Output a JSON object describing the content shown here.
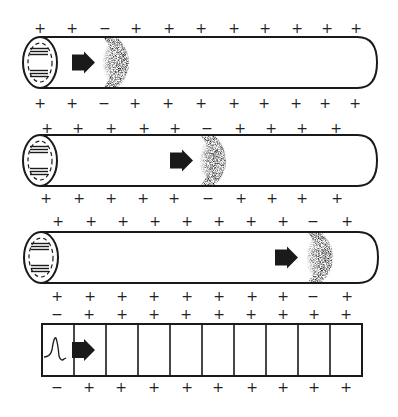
{
  "figure": {
    "colors": {
      "ink": "#1a1a1a",
      "background": "#ffffff",
      "stipple": "#111111"
    },
    "tubes": [
      {
        "id": "tube-1",
        "top": 37,
        "bottom": 88,
        "left": 22,
        "right": 377,
        "arrow_x": 72,
        "wavefront_x": 110,
        "signs_above": {
          "y": 28,
          "x": [
            40,
            72,
            105,
            136,
            169,
            201,
            234,
            265,
            297,
            327,
            356
          ],
          "values": [
            "+",
            "+",
            "−",
            "+",
            "+",
            "+",
            "+",
            "+",
            "+",
            "+",
            "+"
          ]
        },
        "signs_below": {
          "y": 103,
          "x": [
            40,
            72,
            104,
            135,
            168,
            201,
            234,
            264,
            296,
            325,
            355
          ],
          "values": [
            "+",
            "+",
            "−",
            "+",
            "+",
            "+",
            "+",
            "+",
            "+",
            "+",
            "+"
          ]
        }
      },
      {
        "id": "tube-2",
        "top": 135,
        "bottom": 186,
        "left": 22,
        "right": 377,
        "arrow_x": 170,
        "wavefront_x": 207,
        "signs_above": {
          "y": 128,
          "x": [
            47,
            78,
            111,
            144,
            175,
            207,
            240,
            271,
            302,
            336
          ],
          "values": [
            "+",
            "+",
            "+",
            "+",
            "+",
            "−",
            "+",
            "+",
            "+",
            "+"
          ]
        },
        "signs_below": {
          "y": 198,
          "x": [
            46,
            79,
            111,
            143,
            174,
            208,
            241,
            272,
            302,
            337
          ],
          "values": [
            "+",
            "+",
            "+",
            "+",
            "+",
            "−",
            "+",
            "+",
            "+",
            "+"
          ]
        }
      },
      {
        "id": "tube-3",
        "top": 232,
        "bottom": 283,
        "left": 23,
        "right": 378,
        "arrow_x": 275,
        "wavefront_x": 314,
        "signs_above": {
          "y": 221,
          "x": [
            58,
            91,
            123,
            155,
            187,
            219,
            251,
            283,
            313,
            347
          ],
          "values": [
            "+",
            "+",
            "+",
            "+",
            "+",
            "+",
            "+",
            "+",
            "−",
            "+"
          ]
        },
        "signs_below": {
          "y": 296,
          "x": [
            57,
            90,
            122,
            154,
            187,
            219,
            252,
            283,
            313,
            347
          ],
          "values": [
            "+",
            "+",
            "+",
            "+",
            "+",
            "+",
            "+",
            "+",
            "−",
            "+"
          ]
        }
      }
    ],
    "segmented_bar": {
      "left": 42,
      "top": 324,
      "bottom": 376,
      "right": 362,
      "cells": 10,
      "arrow_x": 72,
      "waveform_cell": 0,
      "signs_above": {
        "y": 314,
        "x": [
          57,
          89,
          122,
          154,
          186,
          219,
          251,
          283,
          314,
          346
        ],
        "values": [
          "−",
          "+",
          "+",
          "+",
          "+",
          "+",
          "+",
          "+",
          "+",
          "+"
        ]
      },
      "signs_below": {
        "y": 387,
        "x": [
          57,
          89,
          121,
          154,
          187,
          218,
          252,
          283,
          314,
          346
        ],
        "values": [
          "−",
          "+",
          "+",
          "+",
          "+",
          "+",
          "+",
          "+",
          "+",
          "+"
        ]
      }
    },
    "icons": {
      "direction_arrow": "right-arrow-icon",
      "waveform": "action-potential-spike-icon"
    }
  }
}
